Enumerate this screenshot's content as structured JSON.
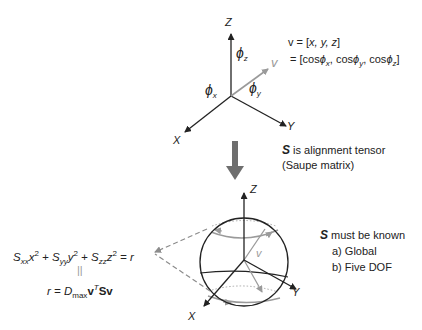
{
  "top_axes": {
    "axis_labels": {
      "z": "Z",
      "x": "X",
      "y": "Y"
    },
    "vector_label": "v",
    "angle_labels": {
      "phi_x": "ϕ",
      "phi_x_sub": "x",
      "phi_y": "ϕ",
      "phi_y_sub": "y",
      "phi_z": "ϕ",
      "phi_z_sub": "z"
    }
  },
  "vector_definition": {
    "line1_prefix": "v = [",
    "line1_vars": "x, y, z",
    "line1_suffix": "]",
    "line2": "= [cosϕ",
    "line2_parts": [
      "= [cos",
      "x",
      ", cos",
      "y",
      ", cos",
      "z",
      "]"
    ]
  },
  "tensor_note": {
    "symbol": "S",
    "line1": " is alignment tensor",
    "line2": "(Saupe matrix)"
  },
  "equation": {
    "lhs_parts": [
      "S",
      "xx",
      "x",
      "2",
      " + S",
      "yy",
      "y",
      "2",
      " + S",
      "zz",
      "z",
      "2",
      " = r"
    ],
    "equals_sign": "||",
    "rhs_parts": [
      "r = D",
      "max",
      "v",
      "T",
      "Sv"
    ]
  },
  "sphere": {
    "axis_labels": {
      "z": "Z",
      "x": "X",
      "y": "Y"
    },
    "vector_label": "v"
  },
  "requirements": {
    "symbol": "S",
    "title": " must be known",
    "items": [
      "a) Global",
      "b) Five DOF"
    ]
  },
  "colors": {
    "ink": "#222222",
    "vector_grey": "#9a9a9a",
    "arrow_grey": "#6e6e6e",
    "dash_grey": "#8c8c8c"
  }
}
